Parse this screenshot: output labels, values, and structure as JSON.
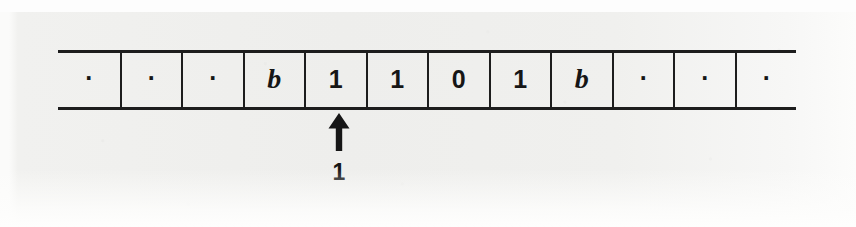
{
  "figure": {
    "background_color": "#f0f0ee",
    "ink_color": "#1d1d1d"
  },
  "tape": {
    "name": "turing-machine-tape",
    "cell_count": 12,
    "cells": [
      {
        "index": 0,
        "symbol": ".",
        "kind": "ellipsis"
      },
      {
        "index": 1,
        "symbol": ".",
        "kind": "ellipsis"
      },
      {
        "index": 2,
        "symbol": ".",
        "kind": "ellipsis"
      },
      {
        "index": 3,
        "symbol": "b",
        "kind": "blank"
      },
      {
        "index": 4,
        "symbol": "1",
        "kind": "digit"
      },
      {
        "index": 5,
        "symbol": "1",
        "kind": "digit"
      },
      {
        "index": 6,
        "symbol": "0",
        "kind": "digit"
      },
      {
        "index": 7,
        "symbol": "1",
        "kind": "digit"
      },
      {
        "index": 8,
        "symbol": "b",
        "kind": "blank"
      },
      {
        "index": 9,
        "symbol": ".",
        "kind": "ellipsis"
      },
      {
        "index": 10,
        "symbol": ".",
        "kind": "ellipsis"
      },
      {
        "index": 11,
        "symbol": ".",
        "kind": "ellipsis"
      }
    ]
  },
  "head": {
    "icon": "up-arrow-icon",
    "points_at_cell_index": 4,
    "state_label": "1"
  }
}
